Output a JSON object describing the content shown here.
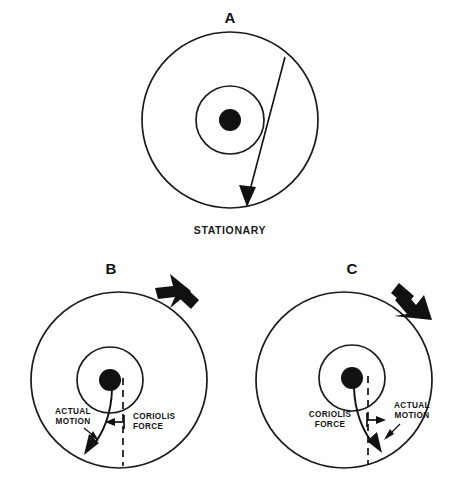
{
  "figure": {
    "title_visible": false,
    "background_color": "#ffffff",
    "ink_color": "#111111",
    "panel_count": 3
  },
  "panels": [
    {
      "id": "A",
      "letter": "A",
      "caption": "STATIONARY",
      "rotation": "none",
      "rotation_arrow_visible": false,
      "trajectory": "straight",
      "annotations": []
    },
    {
      "id": "B",
      "letter": "B",
      "caption": "",
      "rotation": "counterclockwise",
      "rotation_arrow_visible": true,
      "rotation_arrow_direction": "up-left",
      "trajectory": "curved-left",
      "annotations": [
        {
          "label_line1": "ACTUAL",
          "label_line2": "MOTION"
        },
        {
          "label_line1": "CORIOLIS",
          "label_line2": "FORCE"
        }
      ]
    },
    {
      "id": "C",
      "letter": "C",
      "caption": "",
      "rotation": "clockwise",
      "rotation_arrow_visible": true,
      "rotation_arrow_direction": "down-right",
      "trajectory": "curved-right",
      "annotations": [
        {
          "label_line1": "CORIOLIS",
          "label_line2": "FORCE"
        },
        {
          "label_line1": "ACTUAL",
          "label_line2": "MOTION"
        }
      ]
    }
  ],
  "labels": {
    "panel_a_letter": "A",
    "panel_b_letter": "B",
    "panel_c_letter": "C",
    "stationary": "STATIONARY",
    "actual": "ACTUAL",
    "motion": "MOTION",
    "coriolis": "CORIOLIS",
    "force": "FORCE"
  }
}
